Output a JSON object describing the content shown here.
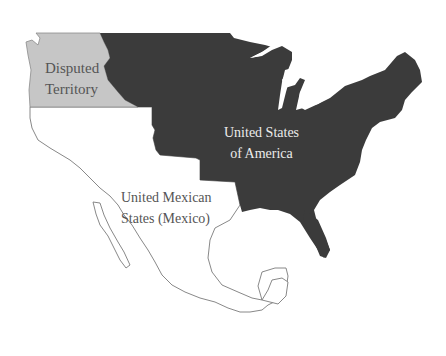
{
  "map": {
    "colors": {
      "usa": "#3b3b3b",
      "disputed": "#c6c6c6",
      "mexico_outline": "#7a7a7a",
      "background": "#ffffff",
      "label_dark_text": "#555555",
      "label_light_text": "#ececec"
    },
    "regions": [
      {
        "id": "disputed",
        "lines": [
          "Disputed",
          "Territory"
        ]
      },
      {
        "id": "usa",
        "lines": [
          "United States",
          "of America"
        ]
      },
      {
        "id": "mexico",
        "lines": [
          "United Mexican",
          "States (Mexico)"
        ]
      }
    ]
  }
}
